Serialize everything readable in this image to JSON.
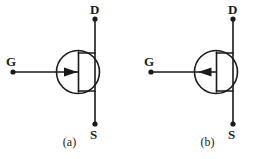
{
  "page": {
    "background_color": "#ffffff",
    "ink_color": "#1a1a1a",
    "width": 277,
    "height": 159
  },
  "figures": [
    {
      "id": "a",
      "caption": "(a)",
      "symbol_name": "n-channel-jfet-symbol",
      "arrow_direction": "right",
      "terminals": [
        {
          "name": "drain",
          "label": "D",
          "position": "top"
        },
        {
          "name": "source",
          "label": "S",
          "position": "bottom"
        },
        {
          "name": "gate",
          "label": "G",
          "position": "left"
        }
      ]
    },
    {
      "id": "b",
      "caption": "(b)",
      "symbol_name": "p-channel-jfet-symbol",
      "arrow_direction": "left",
      "terminals": [
        {
          "name": "drain",
          "label": "D",
          "position": "top"
        },
        {
          "name": "source",
          "label": "S",
          "position": "bottom"
        },
        {
          "name": "gate",
          "label": "G",
          "position": "left"
        }
      ]
    }
  ]
}
